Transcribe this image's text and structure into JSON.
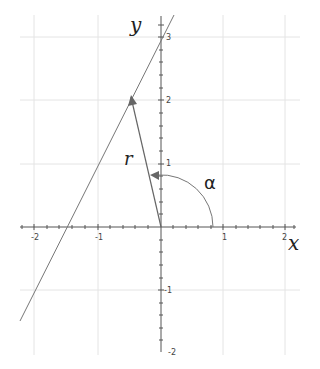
{
  "diagram": {
    "axis_labels": {
      "x": "x",
      "y": "y"
    },
    "vector_label": "r",
    "angle_label": "α",
    "x_ticks": [
      {
        "value": -2,
        "label": "-2"
      },
      {
        "value": -1,
        "label": "-1"
      },
      {
        "value": 1,
        "label": "1"
      },
      {
        "value": 2,
        "label": "2"
      }
    ],
    "y_ticks": [
      {
        "value": 3,
        "label": "3"
      },
      {
        "value": 2,
        "label": "2"
      },
      {
        "value": 1,
        "label": "1"
      },
      {
        "value": -1,
        "label": "-1"
      },
      {
        "value": -2,
        "label": "-2"
      }
    ],
    "line": {
      "equation": "y = 2x + 3"
    },
    "vector": {
      "from": [
        0,
        0
      ],
      "to": [
        -0.5,
        2
      ]
    },
    "colors": {
      "grid": "#e2e2e2",
      "axis": "#555555",
      "curve": "#777777"
    }
  }
}
